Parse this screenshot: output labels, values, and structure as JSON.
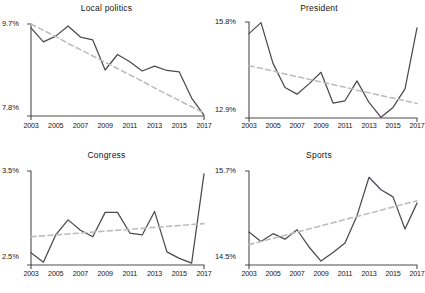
{
  "figure": {
    "background_color": "#ffffff",
    "series_color": "#4a4a52",
    "trend_color": "#bdbdbd",
    "axis_color": "#4d4d4d",
    "text_color": "#171717"
  },
  "chart_data": [
    {
      "type": "line",
      "title": "Local politics",
      "xlabel": "",
      "ylabel": "",
      "grid": false,
      "legend": "none",
      "xlim": [
        2003,
        2017
      ],
      "ylim": [
        7.8,
        9.7
      ],
      "ytick_labels": [
        "9.7%",
        "7.8%"
      ],
      "ytick_values": [
        9.7,
        7.8
      ],
      "xtick_labels": [
        "2003",
        "2005",
        "2007",
        "2009",
        "2011",
        "2013",
        "2015",
        "2017"
      ],
      "xtick_values": [
        2003,
        2005,
        2007,
        2009,
        2011,
        2013,
        2015,
        2017
      ],
      "x": [
        2003,
        2004,
        2005,
        2006,
        2007,
        2008,
        2009,
        2010,
        2011,
        2012,
        2013,
        2014,
        2015,
        2016,
        2017
      ],
      "series": [
        {
          "name": "Local politics share",
          "style": "solid",
          "values": [
            9.62,
            9.33,
            9.45,
            9.66,
            9.43,
            9.37,
            8.75,
            9.07,
            8.92,
            8.73,
            8.83,
            8.74,
            8.71,
            8.17,
            7.82
          ]
        },
        {
          "name": "Linear trend",
          "style": "dashed",
          "values": [
            9.7,
            9.57,
            9.44,
            9.3,
            9.17,
            9.04,
            8.91,
            8.78,
            8.65,
            8.52,
            8.38,
            8.25,
            8.12,
            7.99,
            7.86
          ]
        }
      ]
    },
    {
      "type": "line",
      "title": "President",
      "xlabel": "",
      "ylabel": "",
      "grid": false,
      "legend": "none",
      "xlim": [
        2003,
        2017
      ],
      "ylim": [
        12.9,
        15.8
      ],
      "ytick_labels": [
        "15.8%",
        "12.9%"
      ],
      "ytick_values": [
        15.8,
        12.9
      ],
      "xtick_labels": [
        "2003",
        "2005",
        "2007",
        "2009",
        "2011",
        "2013",
        "2015",
        "2017"
      ],
      "xtick_values": [
        2003,
        2005,
        2007,
        2009,
        2011,
        2013,
        2015,
        2017
      ],
      "x": [
        2003,
        2004,
        2005,
        2006,
        2007,
        2008,
        2009,
        2010,
        2011,
        2012,
        2013,
        2014,
        2015,
        2016,
        2017
      ],
      "series": [
        {
          "name": "President share",
          "style": "solid",
          "values": [
            15.45,
            15.78,
            14.55,
            13.82,
            13.62,
            13.93,
            14.28,
            13.35,
            13.42,
            14.02,
            13.37,
            12.92,
            13.22,
            13.78,
            15.62
          ]
        },
        {
          "name": "Linear trend",
          "style": "dashed",
          "values": [
            14.48,
            14.4,
            14.32,
            14.23,
            14.15,
            14.07,
            13.99,
            13.91,
            13.83,
            13.74,
            13.66,
            13.58,
            13.5,
            13.42,
            13.34
          ]
        }
      ]
    },
    {
      "type": "line",
      "title": "Congress",
      "xlabel": "",
      "ylabel": "",
      "grid": false,
      "legend": "none",
      "xlim": [
        2003,
        2017
      ],
      "ylim": [
        2.5,
        3.5
      ],
      "ytick_labels": [
        "3.5%",
        "2.5%"
      ],
      "ytick_values": [
        3.5,
        2.5
      ],
      "xtick_labels": [
        "2003",
        "2005",
        "2007",
        "2009",
        "2011",
        "2013",
        "2015",
        "2017"
      ],
      "xtick_values": [
        2003,
        2005,
        2007,
        2009,
        2011,
        2013,
        2015,
        2017
      ],
      "x": [
        2003,
        2004,
        2005,
        2006,
        2007,
        2008,
        2009,
        2010,
        2011,
        2012,
        2013,
        2014,
        2015,
        2016,
        2017
      ],
      "series": [
        {
          "name": "Congress share",
          "style": "solid",
          "values": [
            2.63,
            2.53,
            2.82,
            2.98,
            2.87,
            2.8,
            3.06,
            3.06,
            2.84,
            2.82,
            3.07,
            2.64,
            2.57,
            2.52,
            3.47
          ]
        },
        {
          "name": "Linear trend",
          "style": "dashed",
          "values": [
            2.8,
            2.81,
            2.82,
            2.83,
            2.84,
            2.85,
            2.86,
            2.87,
            2.88,
            2.89,
            2.9,
            2.91,
            2.92,
            2.93,
            2.94
          ]
        }
      ]
    },
    {
      "type": "line",
      "title": "Sports",
      "xlabel": "",
      "ylabel": "",
      "grid": false,
      "legend": "none",
      "xlim": [
        2003,
        2017
      ],
      "ylim": [
        14.5,
        15.7
      ],
      "ytick_labels": [
        "15.7%",
        "14.5%"
      ],
      "ytick_values": [
        15.7,
        14.5
      ],
      "xtick_labels": [
        "2003",
        "2005",
        "2007",
        "2009",
        "2011",
        "2013",
        "2015",
        "2017"
      ],
      "xtick_values": [
        2003,
        2005,
        2007,
        2009,
        2011,
        2013,
        2015,
        2017
      ],
      "x": [
        2003,
        2004,
        2005,
        2006,
        2007,
        2008,
        2009,
        2010,
        2011,
        2012,
        2013,
        2014,
        2015,
        2016,
        2017
      ],
      "series": [
        {
          "name": "Sports share",
          "style": "solid",
          "values": [
            14.92,
            14.8,
            14.9,
            14.83,
            14.95,
            14.73,
            14.55,
            14.66,
            14.78,
            15.13,
            15.62,
            15.46,
            15.37,
            14.96,
            15.29
          ]
        },
        {
          "name": "Linear trend",
          "style": "dashed",
          "values": [
            14.76,
            14.8,
            14.84,
            14.88,
            14.92,
            14.96,
            15.0,
            15.04,
            15.08,
            15.12,
            15.16,
            15.2,
            15.24,
            15.28,
            15.32
          ]
        }
      ]
    }
  ]
}
